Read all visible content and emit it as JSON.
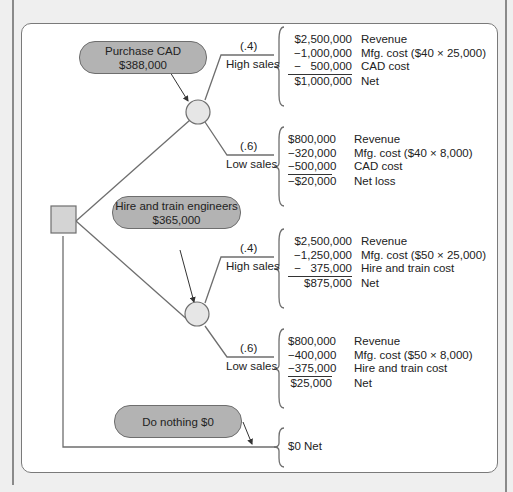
{
  "decisions": {
    "purchase_cad": {
      "label": "Purchase CAD",
      "cost": "$388,000"
    },
    "hire_train": {
      "label": "Hire and train engineers",
      "cost": "$365,000"
    },
    "do_nothing": {
      "label": "Do nothing $0"
    }
  },
  "branches": {
    "cad_high": {
      "prob": "(.4)",
      "label": "High sales"
    },
    "cad_low": {
      "prob": "(.6)",
      "label": "Low sales"
    },
    "hire_high": {
      "prob": "(.4)",
      "label": "High sales"
    },
    "hire_low": {
      "prob": "(.6)",
      "label": "Low sales"
    }
  },
  "outcomes": {
    "cad_high": [
      {
        "amount": "$2,500,000",
        "label": "Revenue"
      },
      {
        "amount": "−1,000,000",
        "label": "Mfg. cost ($40 × 25,000)"
      },
      {
        "amount": "−   500,000",
        "label": "CAD cost"
      },
      {
        "amount": "$1,000,000",
        "label": "Net"
      }
    ],
    "cad_low": [
      {
        "amount": "$800,000",
        "label": "Revenue"
      },
      {
        "amount": "−320,000",
        "label": "Mfg. cost ($40 × 8,000)"
      },
      {
        "amount": "−500,000",
        "label": "CAD cost"
      },
      {
        "amount": "−$20,000",
        "label": "Net loss"
      }
    ],
    "hire_high": [
      {
        "amount": "$2,500,000",
        "label": "Revenue"
      },
      {
        "amount": "−1,250,000",
        "label": "Mfg. cost ($50 × 25,000)"
      },
      {
        "amount": "−   375,000",
        "label": "Hire and train cost"
      },
      {
        "amount": "$875,000",
        "label": "Net"
      }
    ],
    "hire_low": [
      {
        "amount": "$800,000",
        "label": "Revenue"
      },
      {
        "amount": "−400,000",
        "label": "Mfg. cost ($50 × 8,000)"
      },
      {
        "amount": "−375,000",
        "label": "Hire and train cost"
      },
      {
        "amount": "$25,000",
        "label": "Net"
      }
    ],
    "nothing": "$0 Net"
  },
  "colors": {
    "node_fill": "#d9d9d9",
    "pill_fill": "#b3b3b3",
    "line": "#6e6e6e"
  }
}
